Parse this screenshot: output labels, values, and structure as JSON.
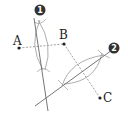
{
  "diagram": {
    "points": [
      {
        "name": "A",
        "label": "A",
        "x": 19,
        "y": 48
      },
      {
        "name": "B",
        "label": "B",
        "x": 64,
        "y": 44
      },
      {
        "name": "C",
        "label": "C",
        "x": 100,
        "y": 98
      }
    ],
    "badges": [
      {
        "label": "1",
        "x": 40,
        "y": 10
      },
      {
        "label": "2",
        "x": 114,
        "y": 48
      }
    ],
    "colors": {
      "ink": "#333333",
      "construction": "#888888",
      "badge": "#333333"
    }
  }
}
